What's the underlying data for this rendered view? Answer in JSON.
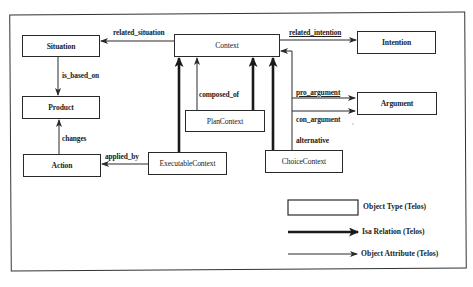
{
  "figure": {
    "nodes": [
      {
        "id": "situation",
        "label": "Situation"
      },
      {
        "id": "context",
        "label": "Context"
      },
      {
        "id": "intention",
        "label": "Intention"
      },
      {
        "id": "product",
        "label": "Product"
      },
      {
        "id": "argument",
        "label": "Argument"
      },
      {
        "id": "plancontext",
        "label": "PlanContext"
      },
      {
        "id": "action",
        "label": "Action"
      },
      {
        "id": "executablecontext",
        "label": "ExecutableContext"
      },
      {
        "id": "choicecontext",
        "label": "ChoiceContext"
      }
    ],
    "edges": {
      "related_situation": "related_situation",
      "related_intention": "related_intention",
      "is_based_on": "is_based_on",
      "composed_of": "composed_of",
      "pro_argument": "pro_argument",
      "con_argument": "con_argument",
      "alternative": "alternative",
      "changes": "changes",
      "applied_by": "applied_by"
    },
    "isa_relations": [
      {
        "from": "PlanContext",
        "to": "Context"
      },
      {
        "from": "ExecutableContext",
        "to": "Context"
      },
      {
        "from": "ChoiceContext",
        "to": "Context"
      }
    ],
    "legend": {
      "object_type": "Object Type (Telos)",
      "isa_relation": "Isa Relation (Telos)",
      "object_attribute": "Object Attribute (Telos)"
    },
    "colors": {
      "line": "#2a2a2a",
      "background": "#ffffff"
    }
  }
}
